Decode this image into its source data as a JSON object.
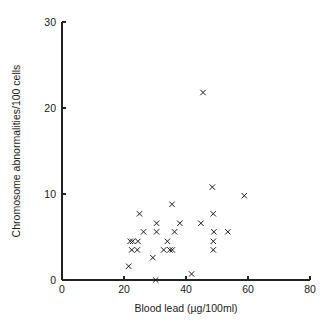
{
  "figure": {
    "name": "scatter-plot-blood-lead-vs-chromosome-abnormalities",
    "background_color": "#ffffff",
    "foreground_color": "#1a1a1a",
    "marker_symbol": "x"
  },
  "chart_data": {
    "type": "scatter",
    "title": "",
    "xlabel": "Blood lead (µg/100ml)",
    "ylabel": "Chromosome abnormalities/100 cells",
    "xlim": [
      0,
      80
    ],
    "ylim": [
      0,
      30
    ],
    "xticks": [
      0,
      20,
      40,
      60,
      80
    ],
    "yticks": [
      0,
      10,
      20,
      30
    ],
    "xtick_labels": [
      "0",
      "20",
      "40",
      "60",
      "80"
    ],
    "ytick_labels": [
      "0",
      "10",
      "20",
      "30"
    ],
    "grid": false,
    "legend": null,
    "series": [
      {
        "name": "subjects",
        "marker": "x",
        "color": "#1a1a1a",
        "points": [
          {
            "x": 21.5,
            "y": 1.6
          },
          {
            "x": 22.0,
            "y": 4.5
          },
          {
            "x": 22.8,
            "y": 4.5
          },
          {
            "x": 22.5,
            "y": 3.5
          },
          {
            "x": 24.3,
            "y": 3.5
          },
          {
            "x": 24.5,
            "y": 4.5
          },
          {
            "x": 25.0,
            "y": 7.7
          },
          {
            "x": 26.3,
            "y": 5.6
          },
          {
            "x": 29.3,
            "y": 2.6
          },
          {
            "x": 30.2,
            "y": 0.0
          },
          {
            "x": 30.5,
            "y": 6.6
          },
          {
            "x": 30.5,
            "y": 5.6
          },
          {
            "x": 32.8,
            "y": 3.5
          },
          {
            "x": 34.0,
            "y": 4.5
          },
          {
            "x": 34.8,
            "y": 3.5
          },
          {
            "x": 35.6,
            "y": 3.5
          },
          {
            "x": 35.5,
            "y": 8.8
          },
          {
            "x": 36.3,
            "y": 5.6
          },
          {
            "x": 38.0,
            "y": 6.6
          },
          {
            "x": 41.8,
            "y": 0.7
          },
          {
            "x": 44.8,
            "y": 6.6
          },
          {
            "x": 45.5,
            "y": 21.8
          },
          {
            "x": 48.5,
            "y": 10.8
          },
          {
            "x": 48.8,
            "y": 7.7
          },
          {
            "x": 49.0,
            "y": 5.6
          },
          {
            "x": 48.8,
            "y": 4.5
          },
          {
            "x": 48.8,
            "y": 3.5
          },
          {
            "x": 53.5,
            "y": 5.6
          },
          {
            "x": 58.8,
            "y": 9.8
          }
        ]
      }
    ]
  }
}
